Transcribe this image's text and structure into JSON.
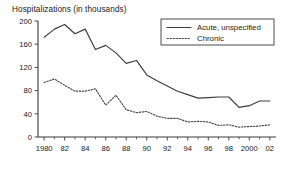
{
  "chart_data": {
    "type": "line",
    "title": "Hospitalizations (in thousands)",
    "xlabel": "",
    "ylabel": "",
    "ylim": [
      0,
      200
    ],
    "xlim": [
      1979.4,
      2002.6
    ],
    "yticks": [
      0,
      40,
      80,
      120,
      160,
      200
    ],
    "ytick_labels": [
      "0",
      "40",
      "80",
      "120",
      "160",
      "200"
    ],
    "xticks": [
      1980,
      1982,
      1984,
      1986,
      1988,
      1990,
      1992,
      1994,
      1996,
      1998,
      2000,
      2002
    ],
    "xtick_labels": [
      "1980",
      "82",
      "84",
      "86",
      "88",
      "90",
      "92",
      "94",
      "96",
      "98",
      "2000",
      "02"
    ],
    "minor_xticks": [
      1981,
      1983,
      1985,
      1987,
      1989,
      1991,
      1993,
      1995,
      1997,
      1999,
      2001
    ],
    "grid": false,
    "legend_position": "top-right",
    "x": [
      1980,
      1981,
      1982,
      1983,
      1984,
      1985,
      1986,
      1987,
      1988,
      1989,
      1990,
      1991,
      1992,
      1993,
      1994,
      1995,
      1996,
      1997,
      1998,
      1999,
      2000,
      2001,
      2002
    ],
    "series": [
      {
        "name": "Acute, unspecified",
        "style": "solid",
        "color": "#3d3d3d",
        "values": [
          172,
          186,
          194,
          178,
          186,
          151,
          158,
          145,
          127,
          132,
          107,
          97,
          88,
          79,
          73,
          67,
          68,
          69,
          69,
          51,
          54,
          62,
          62
        ]
      },
      {
        "name": "Chronic",
        "style": "dotted",
        "color": "#4a4a4a",
        "values": [
          94,
          100,
          89,
          79,
          79,
          83,
          55,
          72,
          47,
          42,
          44,
          36,
          32,
          32,
          26,
          27,
          26,
          20,
          21,
          17,
          18,
          19,
          21
        ]
      }
    ]
  },
  "legend": {
    "entries": [
      {
        "label": "Acute, unspecified",
        "style": "solid"
      },
      {
        "label": "Chronic",
        "style": "dotted"
      }
    ]
  }
}
